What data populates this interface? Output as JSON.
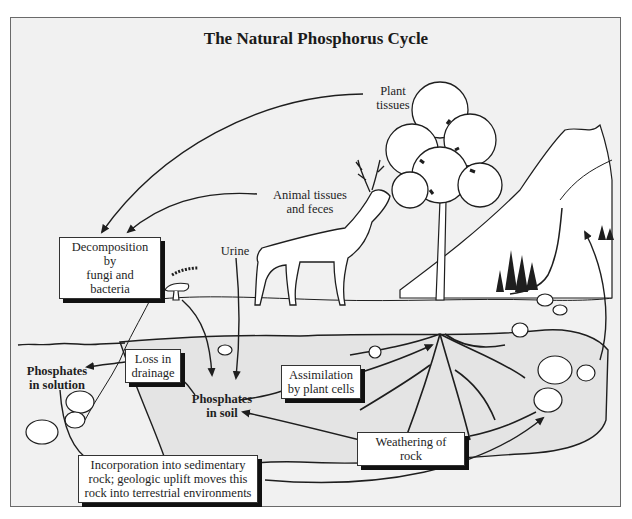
{
  "title": "The Natural Phosphorus Cycle",
  "labels": {
    "plant_tissues": "Plant\ntissues",
    "animal_tissues": "Animal tissues\nand feces",
    "urine": "Urine",
    "phosphates_in_solution": "Phosphates\nin solution",
    "phosphates_in_soil": "Phosphates\nin soil"
  },
  "boxes": {
    "decomposition": "Decomposition by\nfungi and bacteria",
    "loss_in_drainage": "Loss in\ndrainage",
    "assimilation": "Assimilation\nby plant cells",
    "weathering": "Weathering of rock",
    "incorporation": "Incorporation into sedimentary\nrock; geologic uplift moves this\nrock into terrestrial environments"
  },
  "colors": {
    "background": "#f1f1f1",
    "soil": "#e4e4e4",
    "ink": "#1e1e1e",
    "box_shadow": "#111111"
  }
}
